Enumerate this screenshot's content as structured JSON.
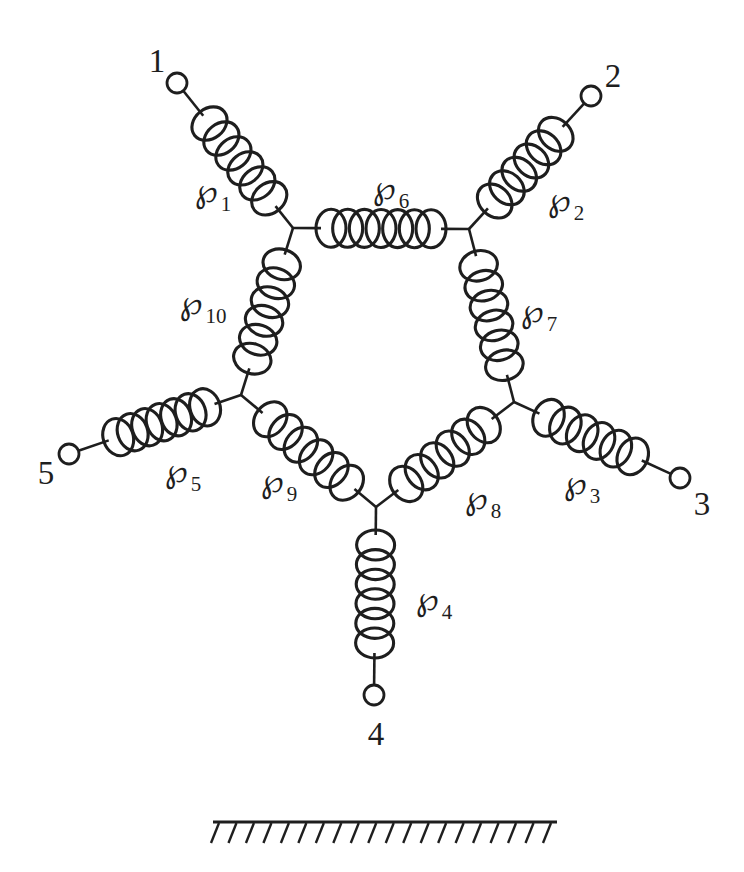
{
  "diagram": {
    "symbol": "℘",
    "terminals": [
      {
        "label": "1"
      },
      {
        "label": "2"
      },
      {
        "label": "3"
      },
      {
        "label": "4"
      },
      {
        "label": "5"
      }
    ],
    "springs": [
      {
        "subscript": "1"
      },
      {
        "subscript": "2"
      },
      {
        "subscript": "3"
      },
      {
        "subscript": "4"
      },
      {
        "subscript": "5"
      },
      {
        "subscript": "6"
      },
      {
        "subscript": "7"
      },
      {
        "subscript": "8"
      },
      {
        "subscript": "9"
      },
      {
        "subscript": "10"
      }
    ],
    "colors": {
      "ink": "#1e1e1e",
      "background": "#ffffff"
    }
  }
}
